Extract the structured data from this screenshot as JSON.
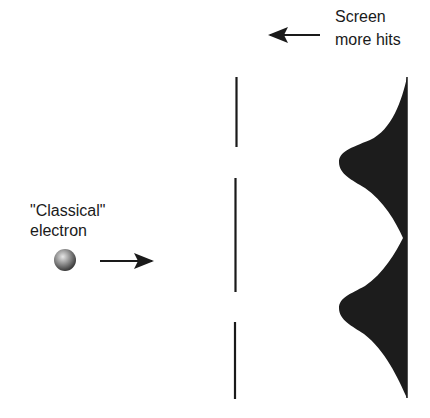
{
  "diagram": {
    "screen_label": {
      "line1": "Screen",
      "line2": "more hits"
    },
    "electron_label": {
      "line1": "\"Classical\"",
      "line2": "electron"
    },
    "icons": {
      "electron": "shaded-sphere",
      "direction_arrow": "arrow-right",
      "screen_arrow": "arrow-left"
    },
    "colors": {
      "ink": "#1a1a1a",
      "distribution_fill": "#1c1c1c",
      "background": "#ffffff"
    }
  }
}
